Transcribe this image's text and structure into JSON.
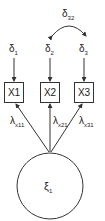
{
  "diagram": {
    "type": "path-diagram",
    "covariance": {
      "symbol": "δ",
      "sub": "32"
    },
    "errors": [
      {
        "symbol": "δ",
        "sub": "1"
      },
      {
        "symbol": "δ",
        "sub": "2"
      },
      {
        "symbol": "δ",
        "sub": "3"
      }
    ],
    "indicators": [
      "X1",
      "X2",
      "X3"
    ],
    "loadings": [
      {
        "symbol": "λ",
        "sub": "x11"
      },
      {
        "symbol": "λ",
        "sub": "x21"
      },
      {
        "symbol": "λ",
        "sub": "x31"
      }
    ],
    "latent": {
      "symbol": "ξ",
      "sub": "1"
    }
  }
}
